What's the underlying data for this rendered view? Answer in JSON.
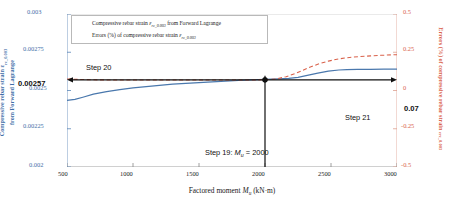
{
  "chart_data": {
    "type": "line",
    "title": "",
    "xlabel": "Factored moment M_u (kN·m)",
    "xlabel_main": "Factored moment",
    "xlabel_sym": "M",
    "xlabel_sub": "u",
    "xlabel_unit": "(kN·m)",
    "xlim": [
      500,
      3000
    ],
    "xticks": [
      500,
      1000,
      1500,
      2000,
      2500,
      3000
    ],
    "xtick_labels": [
      "500",
      "1000",
      "1500",
      "2000",
      "2500",
      "3000"
    ],
    "ylabel_left": "Compressive rebar strain εrc_0.003 from Forward Lagrange",
    "ylabel_left_line1": "Compressive rebar strain ε",
    "ylabel_left_sub": "rc_0.003",
    "ylabel_left_line2": "from Forward Lagrange",
    "ylim_left": [
      0.002,
      0.003
    ],
    "yticks_left": [
      0.002,
      0.00225,
      0.0025,
      0.00275,
      0.003
    ],
    "ytick_labels_left": [
      "0.002",
      "0.00225",
      "0.0025",
      "0.00275",
      "0.003"
    ],
    "ylabel_right": "Errors (%) of compressive rebar strain εrc_0.003",
    "ylabel_right_line1": "Errors (%) of compressive rebar strain",
    "ylabel_right_sub": "εrc_0.003",
    "ylim_right": [
      -0.5,
      0.5
    ],
    "yticks_right": [
      -0.5,
      -0.25,
      0,
      0.25,
      0.5
    ],
    "ytick_labels_right": [
      "-0.5",
      "-0.25",
      "0",
      "0.25",
      "0.5"
    ],
    "grid": false,
    "legend_position": "top-left",
    "series": [
      {
        "name": "Compressive rebar strain εrc_0.003 from Forward Lagrange",
        "legend_text_1": "Compressive rebar strain",
        "legend_sym": "ε",
        "legend_sub": "rc_0.003",
        "legend_text_2": "from Forward Lagrange",
        "axis": "left",
        "color": "#4a78ad",
        "style": "solid",
        "x": [
          500,
          560,
          620,
          700,
          800,
          900,
          1000,
          1100,
          1200,
          1300,
          1400,
          1500,
          1600,
          1700,
          1800,
          1900,
          2000,
          2100,
          2180,
          2250,
          2320,
          2400,
          2480,
          2560,
          2620,
          2700,
          2800,
          2900,
          3000
        ],
        "y": [
          0.002435,
          0.002442,
          0.002456,
          0.002476,
          0.002493,
          0.002506,
          0.002517,
          0.002526,
          0.002534,
          0.002541,
          0.002547,
          0.002552,
          0.002557,
          0.002562,
          0.002566,
          0.002569,
          0.002572,
          0.002576,
          0.00258,
          0.002586,
          0.002599,
          0.002614,
          0.002626,
          0.002634,
          0.002637,
          0.002638,
          0.0026385,
          0.002639,
          0.002639
        ]
      },
      {
        "name": "Errors (%) of compressive rebar strain εrc_0.003",
        "legend_text_1": "Errors (%) of compressive rebar strain",
        "legend_sym": "ε",
        "legend_sub": "rc_0.003",
        "legend_text_2": "",
        "axis": "right",
        "color": "#d9624b",
        "style": "dashed",
        "x": [
          500,
          600,
          700,
          800,
          900,
          1000,
          1100,
          1200,
          1300,
          1400,
          1500,
          1600,
          1700,
          1800,
          1900,
          2000,
          2080,
          2160,
          2240,
          2320,
          2400,
          2480,
          2560,
          2640,
          2720,
          2800,
          2880,
          2960,
          3000
        ],
        "y": [
          0.075,
          0.072,
          0.07,
          0.069,
          0.069,
          0.069,
          0.069,
          0.069,
          0.069,
          0.069,
          0.069,
          0.069,
          0.069,
          0.069,
          0.069,
          0.07,
          0.075,
          0.09,
          0.115,
          0.145,
          0.172,
          0.192,
          0.207,
          0.216,
          0.222,
          0.226,
          0.23,
          0.233,
          0.234
        ]
      }
    ],
    "annotations": [
      {
        "name": "step-20",
        "label": "Step 20",
        "kind": "arrow-left",
        "from_x": 2000,
        "to_x": 500,
        "at_left_value": 0.00257
      },
      {
        "name": "step-21",
        "label": "Step 21",
        "kind": "arrow-right",
        "from_x": 2000,
        "to_x": 3000,
        "at_right_value": 0.07
      },
      {
        "name": "step-19",
        "label": "Step 19:",
        "sym": "M",
        "sub": "u",
        "eq": "= 2000",
        "kind": "vline",
        "at_x": 2000
      },
      {
        "name": "left-readout",
        "label": "0.00257"
      },
      {
        "name": "right-readout",
        "label": "0.07"
      }
    ],
    "markers": [
      {
        "name": "marker-strain",
        "x": 2000,
        "left_value": 0.00257
      },
      {
        "name": "marker-error",
        "x": 2000,
        "right_value": 0.07
      }
    ],
    "colors": {
      "left_axis": "#3f6fa8",
      "right_axis": "#d9624b",
      "series_blue": "#4a78ad",
      "series_red": "#d9624b",
      "annotation": "#101010"
    }
  }
}
